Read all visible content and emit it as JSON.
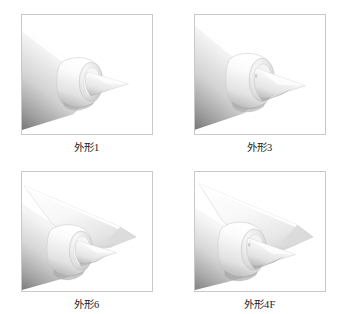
{
  "figure": {
    "type": "multi-panel-cad-render",
    "columns": 2,
    "rows": 2,
    "background_color": "#ffffff",
    "frame_border_color": "#c9c9c9",
    "caption_color": "#1a1a1a"
  },
  "panels": [
    {
      "id": "panel-1",
      "caption": "外形1",
      "position": "top-left",
      "subject": "forebody-with-axisymmetric-inlet-cone",
      "has_wing": false,
      "shading": "grayscale-gradient"
    },
    {
      "id": "panel-2",
      "caption": "外形3",
      "position": "top-right",
      "subject": "forebody-with-axisymmetric-inlet-cone",
      "has_wing": false,
      "shading": "grayscale-gradient"
    },
    {
      "id": "panel-3",
      "caption": "外形6",
      "position": "bottom-left",
      "subject": "forebody-with-inlet-cone-and-delta-strake",
      "has_wing": true,
      "shading": "grayscale-gradient"
    },
    {
      "id": "panel-4",
      "caption": "外形4F",
      "position": "bottom-right",
      "subject": "forebody-with-inlet-cone-and-delta-strake",
      "has_wing": true,
      "shading": "grayscale-gradient"
    }
  ],
  "colors": {
    "body_light": "#ffffff",
    "body_mid": "#e8e8e8",
    "body_shadow": "#8d8d8d",
    "body_deep_shadow": "#6f6f6f",
    "outline": "#b8b8b8",
    "wing_top": "#fafafa",
    "wing_shadow": "#d8d8d8"
  }
}
